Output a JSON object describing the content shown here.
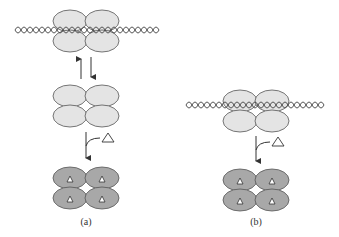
{
  "figure": {
    "colors": {
      "background": "#ffffff",
      "subunit_light": "#e4e4e4",
      "subunit_dark": "#a8a8a8",
      "outline": "#555555",
      "dna": "#444444",
      "inducer_fill": "#ffffff"
    },
    "panels": [
      {
        "id": "a",
        "label": "(a)",
        "states": [
          {
            "name": "tetramer-bound-to-dna",
            "inducer": false,
            "on_dna": true
          },
          {
            "name": "free-tetramer",
            "inducer": false,
            "on_dna": false
          },
          {
            "name": "tetramer-with-inducer",
            "inducer": true,
            "on_dna": false
          }
        ],
        "transitions": [
          "reversible-binding-arrows",
          "inducer-addition-arrow"
        ],
        "inducer_symbol": "triangle"
      },
      {
        "id": "b",
        "label": "(b)",
        "states": [
          {
            "name": "tetramer-bound-to-dna",
            "inducer": false,
            "on_dna": true
          },
          {
            "name": "tetramer-with-inducer",
            "inducer": true,
            "on_dna": false
          }
        ],
        "transitions": [
          "inducer-addition-arrow"
        ],
        "inducer_symbol": "triangle"
      }
    ]
  }
}
